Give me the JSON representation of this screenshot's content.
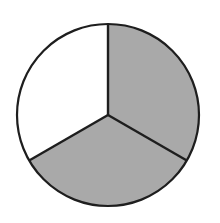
{
  "diagram": {
    "type": "fraction-circle",
    "total_parts": 3,
    "shaded_parts": 2,
    "fraction": "2/3",
    "colors": {
      "background": "#ffffff",
      "shaded": "#a9a9a9",
      "unshaded": "#ffffff",
      "outline": "#1e1e1e"
    },
    "sectors": [
      {
        "id": "right",
        "shaded": true
      },
      {
        "id": "bottom",
        "shaded": true
      },
      {
        "id": "left",
        "shaded": false
      }
    ]
  }
}
